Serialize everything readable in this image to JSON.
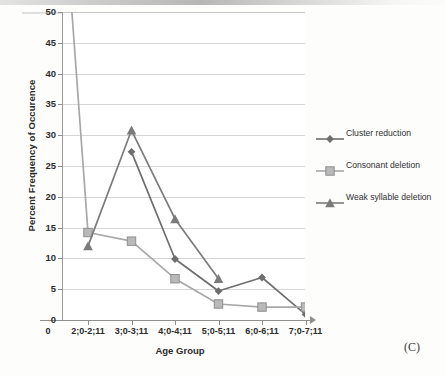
{
  "figure": {
    "caption": "(C)"
  },
  "chart_data": {
    "type": "line",
    "title": "",
    "xlabel": "Age Group",
    "ylabel": "Percent Frequency of Occurence",
    "categories": [
      "2;0-2;11",
      "3;0-3;11",
      "4;0-4;11",
      "5;0-5;11",
      "6;0-6;11",
      "7;0-7;11"
    ],
    "x_origin_label": "0",
    "xtick_labels": [
      "0",
      "2;0-2;11",
      "3;0-3;11",
      "4;0-4;11",
      "5;0-5;11",
      "6;0-6;11",
      "7;0-7;11"
    ],
    "ylim": [
      0,
      50
    ],
    "ytick_labels": [
      "0",
      "5",
      "10",
      "15",
      "20",
      "25",
      "30",
      "35",
      "40",
      "45",
      "50"
    ],
    "ytick_values": [
      0,
      5,
      10,
      15,
      20,
      25,
      30,
      35,
      40,
      45,
      50
    ],
    "grid": "horizontal",
    "legend_position": "right",
    "series": [
      {
        "name": "Cluster reduction",
        "marker": "diamond",
        "color": "#6e6e6e",
        "values": [
          null,
          27.3,
          9.9,
          4.7,
          6.9,
          0.9
        ]
      },
      {
        "name": "Consonant deletion",
        "marker": "square",
        "color": "#a8a8a8",
        "note": "first point is off-scale above the 50 axis maximum",
        "values": [
          14.2,
          12.8,
          6.7,
          2.6,
          2.1,
          2.1
        ]
      },
      {
        "name": "Weak syllable deletion",
        "marker": "triangle",
        "color": "#7b7b7b",
        "values": [
          12.0,
          30.8,
          16.4,
          6.7,
          null,
          null
        ]
      }
    ]
  },
  "legend": {
    "items": [
      {
        "label": "Cluster reduction"
      },
      {
        "label": "Consonant deletion"
      },
      {
        "label": "Weak syllable deletion"
      }
    ]
  }
}
